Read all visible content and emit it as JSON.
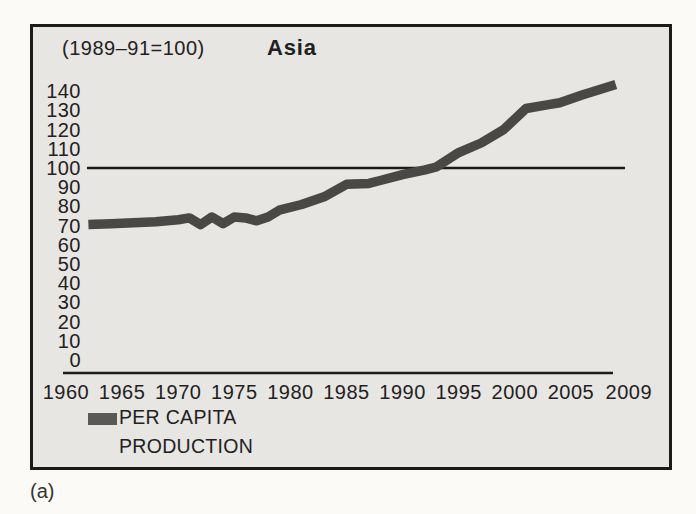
{
  "figure_label": "(a)",
  "chart": {
    "index_note": "(1989–91=100)",
    "region_title": "Asia",
    "legend": {
      "label_line1": "PER CAPITA",
      "label_line2": "PRODUCTION",
      "swatch_color": "#5b5955"
    }
  },
  "colors": {
    "page_bg": "#fbfaf7",
    "box_bg": "#e7e6e2",
    "axis": "#1c1b19",
    "line": "#4a4846",
    "text": "#22211f"
  },
  "chart_data": {
    "type": "line",
    "title": "Asia",
    "subtitle": "(1989–91=100)",
    "xlabel": "",
    "ylabel": "",
    "xlim": [
      1960,
      2009
    ],
    "ylim": [
      0,
      148
    ],
    "x_ticks": [
      1960,
      1965,
      1970,
      1975,
      1980,
      1985,
      1990,
      1995,
      2000,
      2005,
      2009
    ],
    "y_ticks": [
      140,
      130,
      120,
      110,
      100,
      90,
      80,
      70,
      60,
      50,
      40,
      30,
      20,
      10,
      0
    ],
    "reference_line_y": 100,
    "grid": false,
    "legend_position": "bottom-left",
    "series": [
      {
        "name": "PER CAPITA PRODUCTION",
        "points": [
          [
            1962,
            70.5
          ],
          [
            1964,
            71
          ],
          [
            1966,
            71.5
          ],
          [
            1968,
            72
          ],
          [
            1970,
            73
          ],
          [
            1971,
            74
          ],
          [
            1972,
            70.5
          ],
          [
            1973,
            74.5
          ],
          [
            1974,
            71
          ],
          [
            1975,
            74.5
          ],
          [
            1976,
            74
          ],
          [
            1977,
            72.5
          ],
          [
            1978,
            74.5
          ],
          [
            1979,
            78
          ],
          [
            1981,
            81
          ],
          [
            1983,
            85
          ],
          [
            1985,
            91.5
          ],
          [
            1987,
            92
          ],
          [
            1988,
            93.5
          ],
          [
            1990,
            96.5
          ],
          [
            1992,
            99
          ],
          [
            1993,
            100.5
          ],
          [
            1995,
            108
          ],
          [
            1997,
            113
          ],
          [
            1999,
            120
          ],
          [
            2001,
            131
          ],
          [
            2003,
            133
          ],
          [
            2004,
            134
          ],
          [
            2006,
            138
          ],
          [
            2009,
            143.5
          ]
        ]
      }
    ]
  }
}
